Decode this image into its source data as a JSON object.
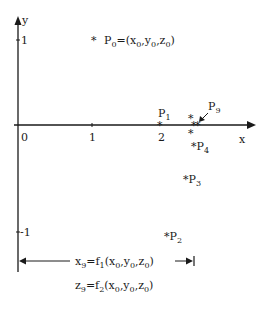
{
  "axes": {
    "x_label": "x",
    "y_label": "y",
    "x_ticks": [
      "0",
      "1",
      "2"
    ],
    "y_ticks": [
      "1",
      "-1"
    ]
  },
  "points": {
    "p0": {
      "name": "P",
      "sub": "0",
      "eq": "=(x",
      "eq_parts": [
        "0",
        ",y",
        "0",
        ",z",
        "0",
        ")"
      ]
    },
    "p1": {
      "name": "P",
      "sub": "1"
    },
    "p2": {
      "name": "P",
      "sub": "2"
    },
    "p3": {
      "name": "P",
      "sub": "3"
    },
    "p4": {
      "name": "P",
      "sub": "4"
    },
    "p9": {
      "name": "P",
      "sub": "9"
    }
  },
  "marker": "*",
  "formulas": {
    "f1": {
      "lhs": "x",
      "lhs_sub": "9",
      "fn": "=f",
      "fn_sub": "1",
      "args": [
        "(x",
        "0",
        ",y",
        "0",
        ",z",
        "0",
        ")"
      ]
    },
    "f2": {
      "lhs": "z",
      "lhs_sub": "9",
      "fn": "=f",
      "fn_sub": "2",
      "args": [
        "(x",
        "0",
        ",y",
        "0",
        ",z",
        "0",
        ")"
      ]
    }
  },
  "colors": {
    "ink": "#1a1a1a",
    "background": "#ffffff"
  }
}
